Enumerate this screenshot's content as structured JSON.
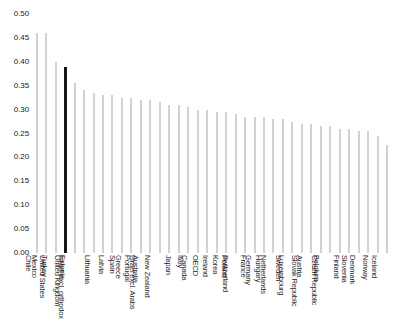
{
  "chart_data": {
    "type": "bar",
    "title": "",
    "xlabel": "",
    "ylabel": "",
    "ylim": [
      0.0,
      0.5
    ],
    "ytick_labels": [
      "0.50",
      "0.45",
      "0.40",
      "0.35",
      "0.30",
      "0.25",
      "0.20",
      "0.15",
      "0.10",
      "0.05",
      "0.00"
    ],
    "ytick_values": [
      0.5,
      0.45,
      0.4,
      0.35,
      0.3,
      0.25,
      0.2,
      0.15,
      0.1,
      0.05,
      0.0
    ],
    "grid": false,
    "legend": "none",
    "bar_color": "#d2d2d2",
    "highlight_color": "#161616",
    "highlight_category": "United States",
    "categories": [
      "Chile",
      "Mexico",
      "Turkey",
      "United States",
      "Estonia",
      "United Kingdom",
      "Israel excl. orthodox",
      "Lithuania",
      "Latvia",
      "Spain",
      "Greece",
      "Portugal",
      "Australia",
      "Israel excl. Arabs",
      "New Zealand",
      "Japan",
      "Italy",
      "Canada",
      "OECD",
      "Ireland",
      "Korea",
      "Poland",
      "Switzerland",
      "France",
      "Germany",
      "Hungary",
      "Netherlands",
      "Sweden",
      "Luxembourg",
      "Austria",
      "Slovak Republic",
      "Belgium",
      "Czech Republic",
      "Finland",
      "Slovenia",
      "Denmark",
      "Norway",
      "Iceland"
    ],
    "values": [
      0.46,
      0.46,
      0.4,
      0.39,
      0.355,
      0.34,
      0.335,
      0.33,
      0.33,
      0.325,
      0.325,
      0.32,
      0.32,
      0.315,
      0.31,
      0.31,
      0.305,
      0.3,
      0.3,
      0.295,
      0.295,
      0.29,
      0.285,
      0.285,
      0.285,
      0.28,
      0.28,
      0.275,
      0.27,
      0.27,
      0.265,
      0.265,
      0.26,
      0.26,
      0.255,
      0.255,
      0.245,
      0.225
    ]
  }
}
